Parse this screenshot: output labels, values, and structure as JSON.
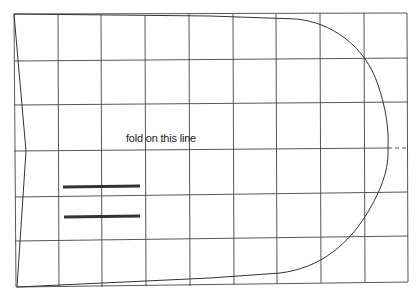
{
  "diagram": {
    "type": "sewing-pattern-piece",
    "label": "fold on this line",
    "colors": {
      "background": "#ffffff",
      "grid": "#444444",
      "outline": "#333333",
      "placement_bars": "#333333"
    },
    "grid": {
      "columns_x": [
        14,
        58,
        101,
        145,
        189,
        233,
        276,
        320,
        364,
        408
      ],
      "rows_y": [
        14,
        60,
        104,
        148,
        192,
        237,
        282
      ]
    },
    "fold_line": {
      "style": "dashed",
      "y": 148,
      "x_from": 388,
      "x_to": 408
    },
    "placement_marks": [
      {
        "x1": 63,
        "x2": 140,
        "y": 187
      },
      {
        "x1": 63,
        "x2": 140,
        "y": 216
      }
    ]
  }
}
